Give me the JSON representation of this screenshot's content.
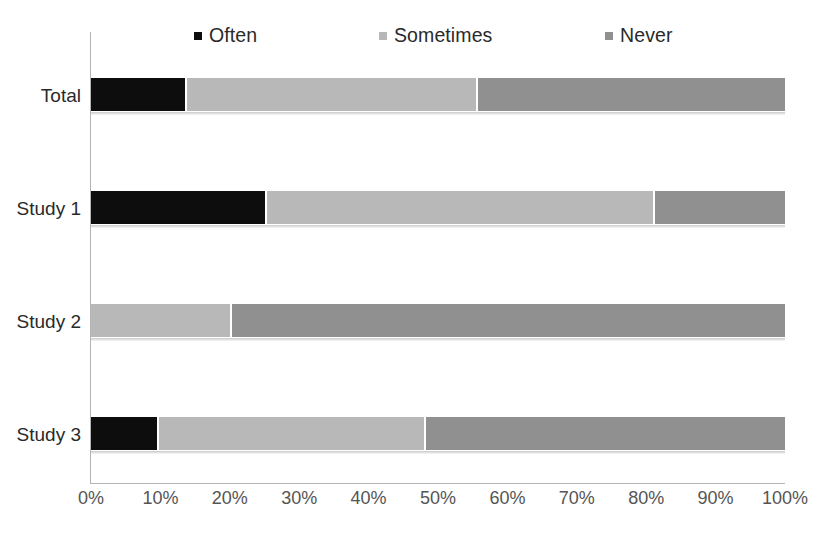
{
  "chart_data": {
    "type": "bar",
    "subtype": "stacked-horizontal-100percent",
    "title": "",
    "subtitle": "",
    "xlabel": "",
    "ylabel": "",
    "xlim": [
      0,
      100
    ],
    "xtick_labels": [
      "0%",
      "10%",
      "20%",
      "30%",
      "40%",
      "50%",
      "60%",
      "70%",
      "80%",
      "90%",
      "100%"
    ],
    "xtick_values": [
      0,
      10,
      20,
      30,
      40,
      50,
      60,
      70,
      80,
      90,
      100
    ],
    "grid": false,
    "legend_position": "top",
    "categories": [
      "Total",
      "Study 1",
      "Study 2",
      "Study 3"
    ],
    "series": [
      {
        "name": "Often",
        "color": "#0d0d0d",
        "values": [
          13.5,
          25.0,
          0.0,
          9.5
        ]
      },
      {
        "name": "Sometimes",
        "color": "#b8b8b8",
        "values": [
          42.0,
          56.0,
          20.0,
          38.5
        ]
      },
      {
        "name": "Never",
        "color": "#909090",
        "values": [
          44.5,
          19.0,
          80.0,
          52.0
        ]
      }
    ],
    "rows": [
      {
        "category": "Total",
        "Often": 13.5,
        "Sometimes": 42.0,
        "Never": 44.5
      },
      {
        "category": "Study 1",
        "Often": 25.0,
        "Sometimes": 56.0,
        "Never": 19.0
      },
      {
        "category": "Study 2",
        "Often": 0.0,
        "Sometimes": 20.0,
        "Never": 80.0
      },
      {
        "category": "Study 3",
        "Often": 9.5,
        "Sometimes": 38.5,
        "Never": 52.0
      }
    ]
  },
  "colors": {
    "often": "#0d0d0d",
    "sometimes": "#b8b8b8",
    "never": "#909090",
    "axis": "#b4b4b4",
    "text": "#2a2a2a",
    "tick_text": "#555555",
    "background": "#ffffff"
  },
  "legend": {
    "items": [
      {
        "label": "Often",
        "color": "#0d0d0d"
      },
      {
        "label": "Sometimes",
        "color": "#b8b8b8"
      },
      {
        "label": "Never",
        "color": "#909090"
      }
    ]
  },
  "axis": {
    "categories": [
      "Total",
      "Study 1",
      "Study 2",
      "Study 3"
    ],
    "xticks": [
      "0%",
      "10%",
      "20%",
      "30%",
      "40%",
      "50%",
      "60%",
      "70%",
      "80%",
      "90%",
      "100%"
    ]
  }
}
